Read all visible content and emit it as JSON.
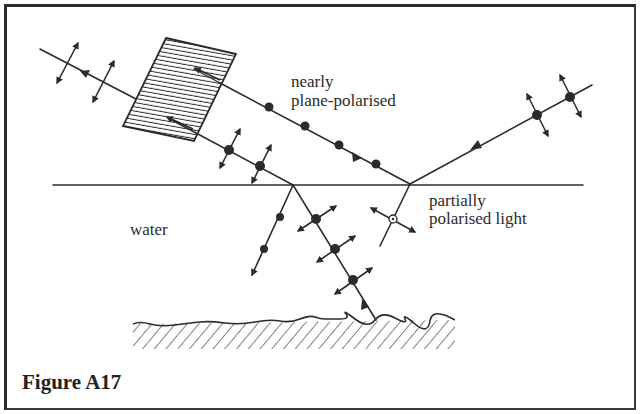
{
  "figure": {
    "caption": "Figure A17",
    "labels": {
      "reflected": [
        "nearly",
        "plane-polarised"
      ],
      "medium": "water",
      "incident": [
        "partially",
        "polarised light"
      ]
    }
  },
  "colors": {
    "ink": "#2b2b2b",
    "background": "#ffffff"
  },
  "elements": {
    "water_surface": "horizontal line (water surface)",
    "polaroid_filter": "hatched parallelogram (polarising filter)",
    "riverbed": "hatched ground/bottom surface",
    "symbols": {
      "dot": "polarisation perpendicular to page",
      "double_arrow": "polarisation in plane of page",
      "circled_dot": "partially polarised"
    }
  }
}
